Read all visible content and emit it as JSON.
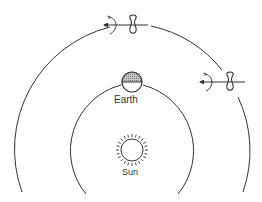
{
  "diagram": {
    "labels": {
      "earth": "Earth",
      "sun": "Sun"
    },
    "colors": {
      "line": "#333333",
      "earth_shade": "#9a9a9a",
      "background": "#ffffff"
    },
    "elements": {
      "sun": {
        "cx": 132,
        "cy": 150,
        "r": 11
      },
      "earth": {
        "cx": 132,
        "cy": 82,
        "r": 10,
        "shaded_half": "top"
      },
      "inner_orbit": {
        "r": 68
      },
      "outer_orbit": {
        "r": 126
      },
      "satellites": [
        {
          "id": "top",
          "cx": 133,
          "cy": 25
        },
        {
          "id": "right",
          "cx": 230,
          "cy": 82
        }
      ]
    }
  }
}
